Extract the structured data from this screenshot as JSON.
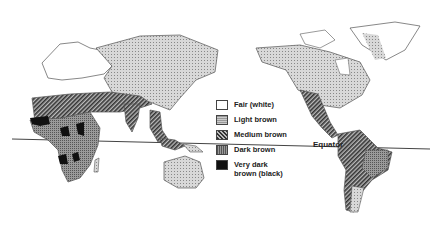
{
  "map": {
    "subject": "Distribution of human skin color",
    "equator_label": "Equator",
    "legend": [
      {
        "label": "Fair (white)",
        "pattern": "white",
        "color": "#ffffff"
      },
      {
        "label": "Light brown",
        "pattern": "light-dots",
        "color": "#c8c8c8"
      },
      {
        "label": "Medium brown",
        "pattern": "hatch",
        "color": "#6a6a6a"
      },
      {
        "label": "Dark brown",
        "pattern": "dark-dots",
        "color": "#9a9a9a"
      },
      {
        "label": "Very dark\nbrown (black)",
        "pattern": "solid-black",
        "color": "#111111"
      }
    ]
  }
}
